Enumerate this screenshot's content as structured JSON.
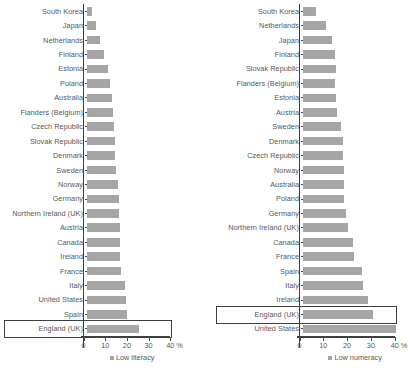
{
  "chart_data": [
    {
      "type": "bar",
      "orientation": "horizontal",
      "title": "",
      "xlabel": "%",
      "ylabel": "",
      "xlim": [
        0,
        40
      ],
      "xticks": [
        0,
        10,
        20,
        30,
        40
      ],
      "xtick_labels": [
        "0",
        "10",
        "20",
        "30",
        "40"
      ],
      "grid": false,
      "legend": {
        "position": "bottom",
        "entries": [
          "Low literacy"
        ]
      },
      "series_name": "Low literacy",
      "bar_color": "#a6a6a6",
      "highlighted_category": "England (UK)",
      "categories": [
        "South Korea",
        "Japan",
        "Netherlands",
        "Finland",
        "Estonia",
        "Poland",
        "Australia",
        "Flanders (Belgium)",
        "Czech Republic",
        "Slovak Republic",
        "Denmark",
        "Sweden",
        "Norway",
        "Germany",
        "Northern Ireland (UK)",
        "Austria",
        "Canada",
        "Ireland",
        "France",
        "Italy",
        "United States",
        "Spain",
        "England (UK)"
      ],
      "values": [
        2.2,
        4.3,
        6.0,
        7.7,
        9.5,
        10.6,
        11.6,
        12.1,
        12.6,
        12.8,
        13.0,
        13.4,
        14.3,
        14.7,
        14.9,
        15.2,
        15.3,
        15.4,
        15.5,
        17.6,
        18.2,
        18.5,
        23.8
      ]
    },
    {
      "type": "bar",
      "orientation": "horizontal",
      "title": "",
      "xlabel": "%",
      "ylabel": "",
      "xlim": [
        0,
        40
      ],
      "xticks": [
        0,
        10,
        20,
        30,
        40
      ],
      "xtick_labels": [
        "0",
        "10",
        "20",
        "30",
        "40"
      ],
      "grid": false,
      "legend": {
        "position": "bottom",
        "entries": [
          "Low numeracy"
        ]
      },
      "series_name": "Low numeracy",
      "bar_color": "#a6a6a6",
      "highlighted_category": "England (UK)",
      "categories": [
        "South Korea",
        "Netherlands",
        "Japan",
        "Finland",
        "Slovak Republic",
        "Flanders (Belgium)",
        "Estonia",
        "Austria",
        "Sweden",
        "Denmark",
        "Czech Republic",
        "Norway",
        "Australia",
        "Poland",
        "Germany",
        "Northern Ireland (UK)",
        "Canada",
        "France",
        "Spain",
        "Italy",
        "Ireland",
        "England (UK)",
        "United States"
      ],
      "values": [
        5.3,
        9.5,
        12.3,
        13.4,
        13.7,
        13.5,
        13.8,
        14.4,
        15.8,
        16.9,
        17.0,
        17.2,
        17.2,
        17.3,
        18.0,
        19.0,
        21.2,
        21.3,
        24.8,
        25.0,
        27.4,
        29.4,
        39.0
      ]
    }
  ],
  "left_chart": {
    "unit_label": "%",
    "legend_label": "Low literacy"
  },
  "right_chart": {
    "unit_label": "%",
    "legend_label": "Low numeracy"
  }
}
